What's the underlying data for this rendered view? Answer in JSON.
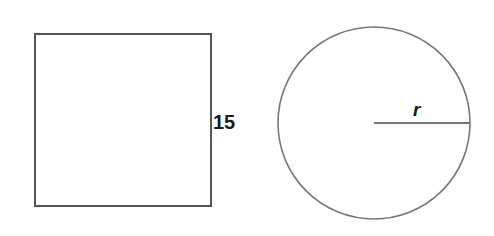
{
  "figure": {
    "background_color": "#ffffff",
    "shapes": [
      {
        "name": "square",
        "kind": "square",
        "stroke_color": "#555555",
        "stroke_width": 2,
        "fill": "none",
        "x": 34,
        "y": 33,
        "width": 177,
        "height": 173,
        "label": "15",
        "label_meaning": "side length"
      },
      {
        "name": "circle",
        "kind": "circle",
        "stroke_color": "#777777",
        "stroke_width": 1.6,
        "fill": "none",
        "center_x": 374,
        "center_y": 123,
        "radius": 96,
        "label": "r",
        "label_meaning": "radius"
      }
    ],
    "radius_line": {
      "name": "radius-segment",
      "stroke_color": "#777777",
      "stroke_width": 2,
      "x1": 374,
      "y1": 123,
      "x2": 470,
      "y2": 123
    }
  },
  "labels": {
    "square_side": "15",
    "circle_radius": "r"
  }
}
